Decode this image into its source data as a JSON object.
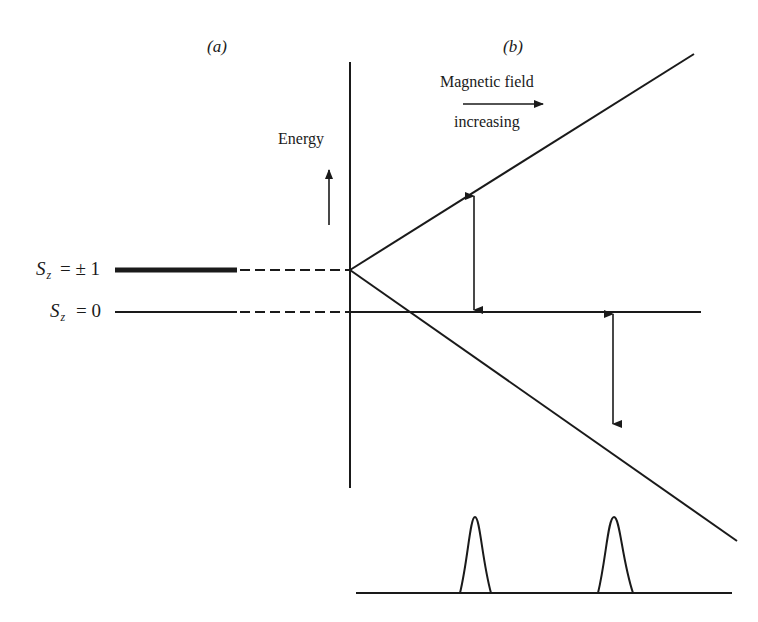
{
  "panels": {
    "a_label": "(a)",
    "b_label": "(b)"
  },
  "axis": {
    "energy_label": "Energy",
    "field_label_line1": "Magnetic field",
    "field_label_line2": "increasing"
  },
  "levels": [
    {
      "symbol": "S",
      "subscript": "z",
      "relation": "= ± 1"
    },
    {
      "symbol": "S",
      "subscript": "z",
      "relation": "= 0"
    }
  ],
  "spectrum": {
    "peaks": 2
  },
  "colors": {
    "ink": "#1a1a1a",
    "background": "#ffffff"
  }
}
